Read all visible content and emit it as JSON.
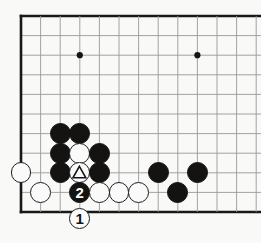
{
  "diagram": {
    "kind": "go-board-problem-diagram",
    "board_size_visible": {
      "cols": 13,
      "rows": 11
    },
    "geometry": {
      "origin_x": 21,
      "origin_y": 16,
      "step": 19.6,
      "stone_radius": 10.4,
      "edge_line_width": 2.6,
      "inner_line_width": 0.9
    },
    "colors": {
      "background": "#fdfdfc",
      "line": "#9a9a9a",
      "edge_line": "#141414",
      "black_stone": "#100f0d",
      "white_stone": "#fefefe",
      "white_stone_border": "#1a1a1a",
      "star_point": "#111111"
    },
    "edges": {
      "left": true,
      "top": true,
      "bottom": true,
      "right": false
    },
    "star_points": [
      {
        "col": 3,
        "row": 2
      },
      {
        "col": 9,
        "row": 2
      },
      {
        "col": 9,
        "row": 8
      }
    ],
    "stones": [
      {
        "color": "black",
        "col": 2,
        "row": 6,
        "label": ""
      },
      {
        "color": "black",
        "col": 3,
        "row": 6,
        "label": ""
      },
      {
        "color": "black",
        "col": 2,
        "row": 7,
        "label": ""
      },
      {
        "color": "white",
        "col": 3,
        "row": 7,
        "label": ""
      },
      {
        "color": "black",
        "col": 4,
        "row": 7,
        "label": ""
      },
      {
        "color": "white",
        "col": 0,
        "row": 8,
        "label": ""
      },
      {
        "color": "black",
        "col": 2,
        "row": 8,
        "label": ""
      },
      {
        "color": "white",
        "col": 3,
        "row": 8,
        "label": "triangle"
      },
      {
        "color": "black",
        "col": 4,
        "row": 8,
        "label": ""
      },
      {
        "color": "black",
        "col": 7,
        "row": 8,
        "label": ""
      },
      {
        "color": "black",
        "col": 9,
        "row": 8,
        "label": ""
      },
      {
        "color": "white",
        "col": 1,
        "row": 9,
        "label": ""
      },
      {
        "color": "black",
        "col": 3,
        "row": 9,
        "label": "2"
      },
      {
        "color": "white",
        "col": 4,
        "row": 9,
        "label": ""
      },
      {
        "color": "white",
        "col": 5,
        "row": 9,
        "label": ""
      },
      {
        "color": "white",
        "col": 6,
        "row": 9,
        "label": ""
      },
      {
        "color": "black",
        "col": 8,
        "row": 9,
        "label": ""
      }
    ],
    "offboard_moves": [
      {
        "color": "white",
        "col": 3,
        "row": 10.35,
        "label": "1"
      }
    ],
    "move_labels": {
      "move_one": "1",
      "move_two": "2",
      "marked_stone": "triangle"
    }
  }
}
